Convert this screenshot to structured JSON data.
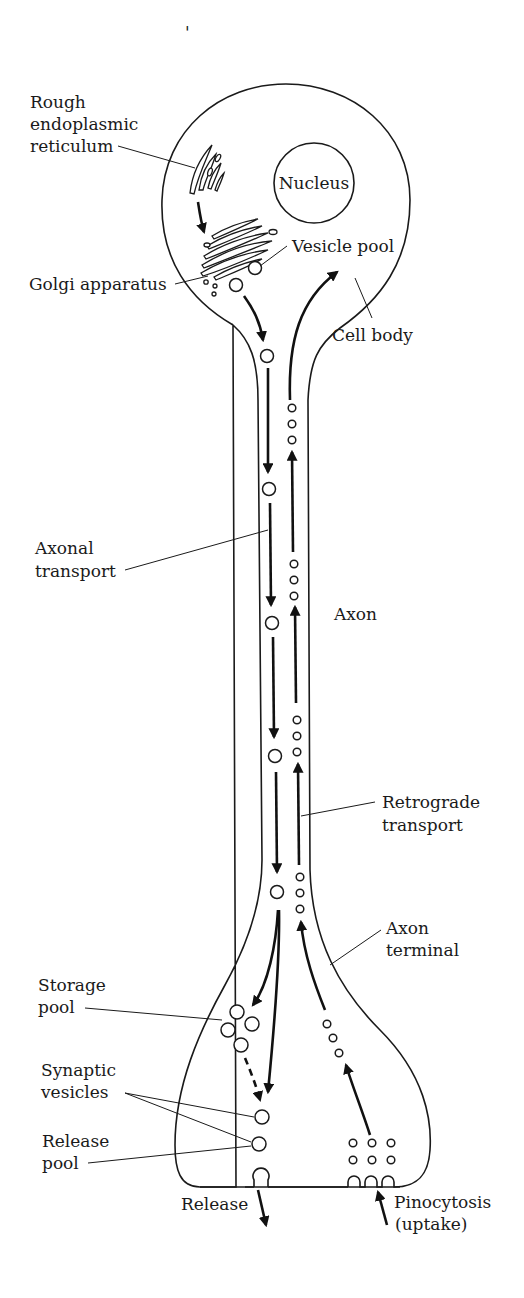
{
  "figure": {
    "type": "neuron-axonal-transport-diagram",
    "stray_mark": "'"
  },
  "labels": {
    "rough_er": [
      "Rough",
      "endoplasmic",
      "reticulum"
    ],
    "nucleus": "Nucleus",
    "vesicle_pool": "Vesicle pool",
    "golgi": "Golgi apparatus",
    "cell_body": "Cell body",
    "axonal_transport": [
      "Axonal",
      "transport"
    ],
    "axon": "Axon",
    "retrograde_transport": [
      "Retrograde",
      "transport"
    ],
    "axon_terminal": [
      "Axon",
      "terminal"
    ],
    "storage_pool": [
      "Storage",
      "pool"
    ],
    "synaptic_vesicles": [
      "Synaptic",
      "vesicles"
    ],
    "release_pool": [
      "Release",
      "pool"
    ],
    "release": "Release",
    "pinocytosis": [
      "Pinocytosis",
      "(uptake)"
    ]
  },
  "colors": {
    "ink": "#1a1a1a",
    "background": "#ffffff"
  }
}
